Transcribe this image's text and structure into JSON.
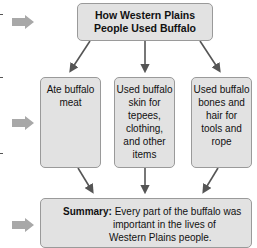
{
  "diagram": {
    "title": {
      "line1": "How Western Plains",
      "line2": "People Used Buffalo"
    },
    "details": [
      {
        "lines": [
          "Ate buffalo",
          "meat"
        ]
      },
      {
        "lines": [
          "Used buffalo",
          "skin for",
          "tepees,",
          "clothing,",
          "and other",
          "items"
        ]
      },
      {
        "lines": [
          "Used buffalo",
          "bones and",
          "hair for",
          "tools and",
          "rope"
        ]
      }
    ],
    "summary": {
      "label": "Summary:",
      "line1": "Every part of the buffalo was",
      "line2": "important in the lives of",
      "line3": "Western Plains people."
    },
    "colors": {
      "box_fill": "#e2e2e2",
      "box_border": "#9a9a9a",
      "connector": "#555555",
      "side_arrow": "#a8a8a8"
    },
    "side_arrows": [
      "arrow-to-title",
      "arrow-to-details",
      "arrow-to-summary"
    ]
  }
}
